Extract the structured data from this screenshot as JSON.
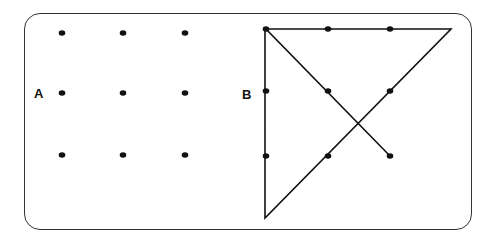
{
  "figure": {
    "panel_a": {
      "label": "A",
      "dots": [
        [
          62,
          33
        ],
        [
          123,
          33
        ],
        [
          185,
          33
        ],
        [
          62,
          93
        ],
        [
          123,
          93
        ],
        [
          185,
          93
        ],
        [
          62,
          155
        ],
        [
          123,
          155
        ],
        [
          185,
          155
        ]
      ]
    },
    "panel_b": {
      "label": "B",
      "dots": [
        [
          266,
          29
        ],
        [
          328,
          29
        ],
        [
          390,
          29
        ],
        [
          266,
          91
        ],
        [
          328,
          91
        ],
        [
          390,
          91
        ],
        [
          266,
          156
        ],
        [
          328,
          156
        ],
        [
          390,
          156
        ]
      ],
      "path": [
        [
          390,
          156
        ],
        [
          266,
          29
        ],
        [
          451,
          29
        ],
        [
          265,
          218
        ],
        [
          265,
          29
        ]
      ]
    },
    "colors": {
      "ink": "#111111",
      "border": "#333333"
    }
  }
}
